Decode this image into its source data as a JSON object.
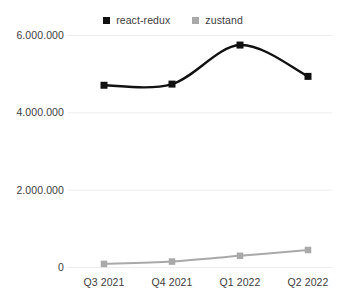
{
  "chart_data": {
    "type": "line",
    "title": "",
    "subtitle": "",
    "xlabel": "",
    "ylabel": "",
    "categories": [
      "Q3 2021",
      "Q4 2021",
      "Q1 2022",
      "Q2 2022"
    ],
    "ytick_labels": [
      "0",
      "2.000.000",
      "4.000.000",
      "6.000.000"
    ],
    "ytick_values": [
      0,
      2000000,
      4000000,
      6000000
    ],
    "ylim": [
      0,
      6200000
    ],
    "grid": true,
    "grid_axis": "y",
    "legend_position": "top-center",
    "marker": "square",
    "line_style": "smooth",
    "series": [
      {
        "name": "react-redux",
        "color": "#111111",
        "values": [
          4700000,
          4730000,
          5740000,
          4930000
        ]
      },
      {
        "name": "zustand",
        "color": "#a9a9a9",
        "values": [
          80000,
          140000,
          290000,
          440000
        ]
      }
    ]
  },
  "colors": {
    "background": "#ffffff",
    "grid": "#ededed",
    "axis_text": "#3c3c3c",
    "series_react_redux": "#111111",
    "series_zustand": "#a9a9a9"
  },
  "legend": {
    "items": [
      {
        "label": "react-redux",
        "swatch_name": "legend-swatch-react-redux",
        "color": "#111111"
      },
      {
        "label": "zustand",
        "swatch_name": "legend-swatch-zustand",
        "color": "#a9a9a9"
      }
    ]
  }
}
